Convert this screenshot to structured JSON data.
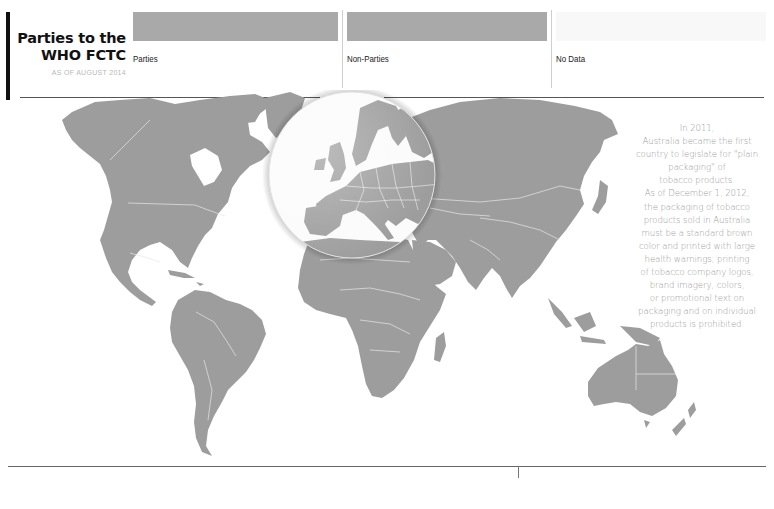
{
  "header": {
    "title_line1": "Parties to the",
    "title_line2": "WHO FCTC",
    "subtitle": "AS OF AUGUST 2014"
  },
  "legend": {
    "items": [
      {
        "label": "Parties",
        "color": "#a9a9a9"
      },
      {
        "label": "Non-Parties",
        "color": "#a9a9a9"
      },
      {
        "label": "No Data",
        "color": "#f8f8f8"
      }
    ]
  },
  "map": {
    "land_color": "#9d9d9d",
    "border_color": "#e6e6e6",
    "highlight_region": "Europe",
    "highlight_style": "magnifier-lens"
  },
  "callout": {
    "lines": [
      "In 2011,",
      "Australia became the first",
      "country to legislate for \"plain",
      "packaging\" of",
      "tobacco products.",
      "As of December 1, 2012,",
      "the packaging of tobacco",
      "products sold in Australia",
      "must be a standard brown",
      "color and printed with large",
      "health warnings; printing",
      "of tobacco company logos,",
      "brand imagery, colors,",
      "or promotional text on",
      "packaging and on individual",
      "products is prohibited."
    ]
  }
}
